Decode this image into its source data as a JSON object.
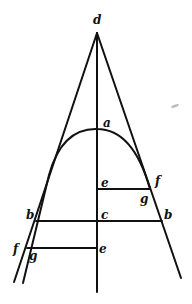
{
  "diagram": {
    "type": "geometric-construction",
    "stroke_color": "#111111",
    "background": "#ffffff",
    "points": {
      "d": {
        "x": 97,
        "y": 33
      },
      "a": {
        "x": 97,
        "y": 129
      },
      "c": {
        "x": 97,
        "y": 221
      },
      "e_upper": {
        "x": 97,
        "y": 189
      },
      "e_lower": {
        "x": 97,
        "y": 248
      },
      "b_left": {
        "x": 36,
        "y": 221
      },
      "b_right": {
        "x": 162,
        "y": 221
      },
      "f_right": {
        "x": 150,
        "y": 189
      },
      "g_right": {
        "x": 150,
        "y": 189
      },
      "f_left": {
        "x": 28,
        "y": 248
      },
      "g_left": {
        "x": 28,
        "y": 248
      }
    },
    "labels": [
      {
        "id": "d",
        "text": "d",
        "x": 93,
        "y": 14
      },
      {
        "id": "a",
        "text": "a",
        "x": 103,
        "y": 117
      },
      {
        "id": "e-upper",
        "text": "e",
        "x": 101,
        "y": 177
      },
      {
        "id": "f-right",
        "text": "f",
        "x": 155,
        "y": 175
      },
      {
        "id": "g-right",
        "text": "g",
        "x": 140,
        "y": 193
      },
      {
        "id": "b-left",
        "text": "b",
        "x": 26,
        "y": 209
      },
      {
        "id": "c",
        "text": "c",
        "x": 101,
        "y": 209
      },
      {
        "id": "b-right",
        "text": "b",
        "x": 164,
        "y": 209
      },
      {
        "id": "f-left",
        "text": "f",
        "x": 13,
        "y": 243
      },
      {
        "id": "g-left",
        "text": "g",
        "x": 29,
        "y": 250
      },
      {
        "id": "e-lower",
        "text": "e",
        "x": 99,
        "y": 243
      }
    ]
  }
}
